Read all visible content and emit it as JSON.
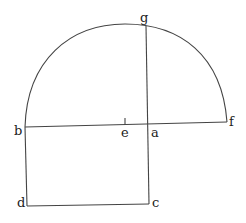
{
  "diagram": {
    "type": "geometric-construction",
    "stroke_color": "#444444",
    "label_color": "#222222",
    "points": {
      "a": {
        "label": "a",
        "x": 148,
        "y": 124
      },
      "b": {
        "label": "b",
        "x": 25,
        "y": 127
      },
      "c": {
        "label": "c",
        "x": 149,
        "y": 204
      },
      "d": {
        "label": "d",
        "x": 27,
        "y": 206
      },
      "e": {
        "label": "e",
        "x": 125,
        "y": 125
      },
      "f": {
        "label": "f",
        "x": 227,
        "y": 122
      },
      "g": {
        "label": "g",
        "x": 146,
        "y": 26
      }
    },
    "segments": [
      {
        "from": "b",
        "to": "f"
      },
      {
        "from": "g",
        "to": "c"
      },
      {
        "from": "b",
        "to": "d"
      },
      {
        "from": "d",
        "to": "c"
      }
    ],
    "arcs": [
      {
        "from": "b",
        "to": "f",
        "center": "e",
        "kind": "semicircle"
      }
    ],
    "tick_marks": [
      "e"
    ]
  }
}
